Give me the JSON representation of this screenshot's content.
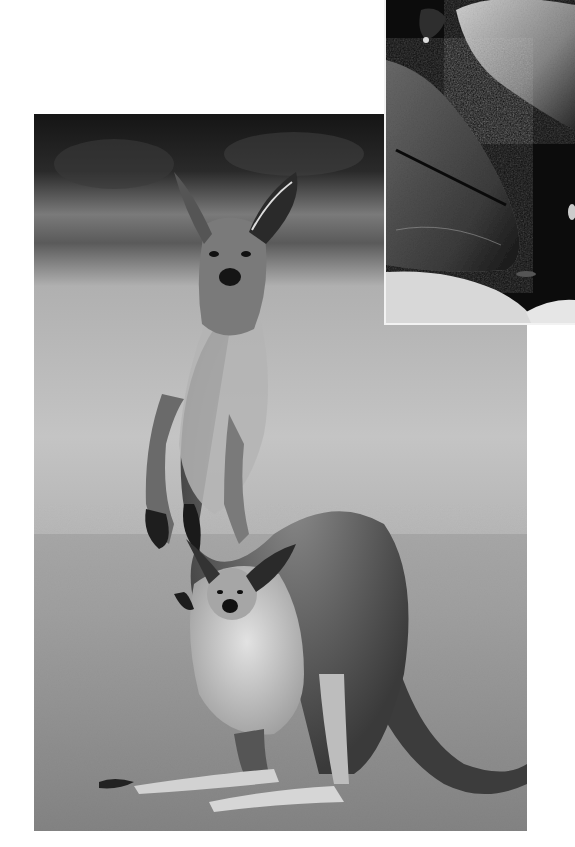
{
  "page": {
    "type": "scanned printed page",
    "background_color": "#ffffff"
  },
  "images": [
    {
      "id": "main",
      "subject": "Grey kangaroo standing upright with a joey peeking out of its pouch on a grassy field",
      "tone": "grayscale",
      "bbox": {
        "x": 34,
        "y": 114,
        "w": 493,
        "h": 717
      }
    },
    {
      "id": "inset",
      "subject": "Close-up of dark, textured rock surfaces",
      "tone": "grayscale",
      "bbox": {
        "x": 384,
        "y": 0,
        "w": 191,
        "h": 325
      }
    }
  ],
  "colors": {
    "sky_dark": "#1a1a1a",
    "field_light": "#b8b8b8",
    "grass": "#8c8c8c",
    "fur_dark": "#3a3a3a",
    "fur_light": "#d0d0d0",
    "rock_dark": "#0d0d0d",
    "rock_mid": "#555555",
    "rock_light": "#cfcfcf"
  }
}
